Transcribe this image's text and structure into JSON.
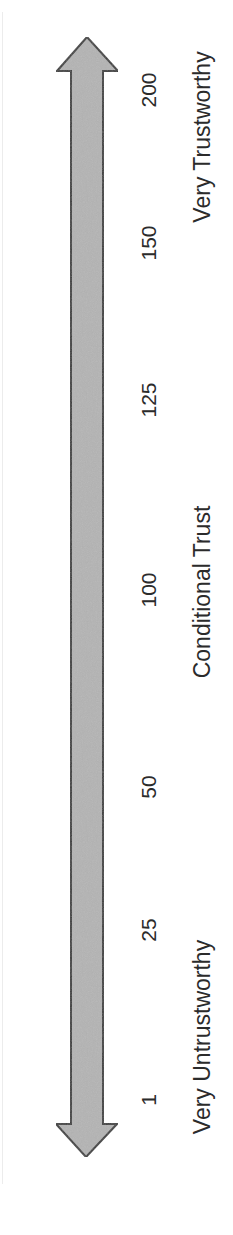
{
  "diagram": {
    "type": "trust-scale",
    "orientation": "vertical (rotated 90° counter-clockwise)",
    "arrow": {
      "style": "double-headed",
      "fill_color": "#b4b4b4",
      "stroke_color": "#3a3a3a"
    },
    "ticks": [
      {
        "value": "1",
        "y": 1100
      },
      {
        "value": "25",
        "y": 930
      },
      {
        "value": "50",
        "y": 787
      },
      {
        "value": "100",
        "y": 590
      },
      {
        "value": "125",
        "y": 400
      },
      {
        "value": "150",
        "y": 243
      },
      {
        "value": "200",
        "y": 90
      }
    ],
    "anchors": [
      {
        "label": "Very Untrustworthy",
        "y": 1037
      },
      {
        "label": "Conditional Trust",
        "y": 592
      },
      {
        "label": "Very Trustworthy",
        "y": 137
      }
    ]
  }
}
